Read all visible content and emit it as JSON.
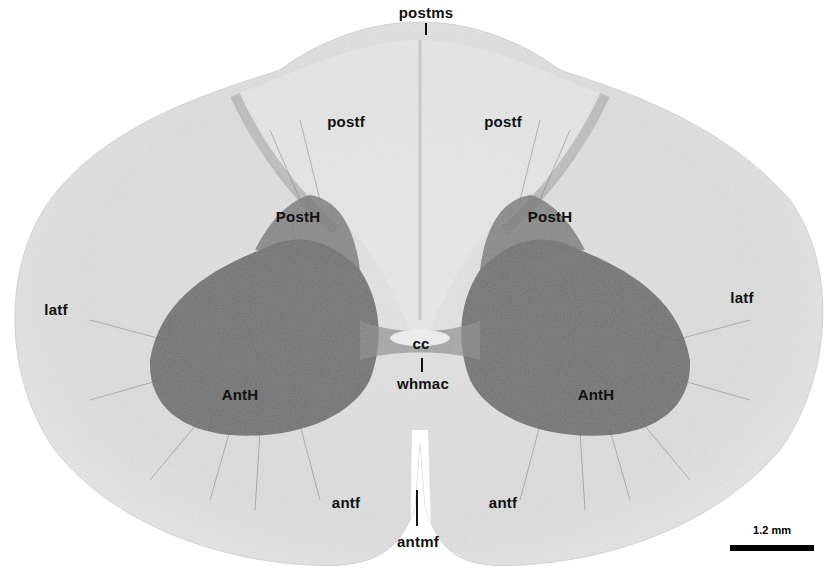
{
  "figure": {
    "labels": {
      "postms": "postms",
      "postf_left": "postf",
      "postf_right": "postf",
      "posth_left": "PostH",
      "posth_right": "PostH",
      "latf_left": "latf",
      "latf_right": "latf",
      "cc": "cc",
      "whmac": "whmac",
      "anth_left": "AntH",
      "anth_right": "AntH",
      "antf_left": "antf",
      "antf_right": "antf",
      "antmf": "antmf"
    },
    "scale_bar": {
      "label": "1.2 mm"
    }
  }
}
